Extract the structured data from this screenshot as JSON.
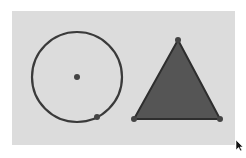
{
  "canvas": {
    "background": "#dcdcdc",
    "rect": {
      "x": 12,
      "y": 11,
      "width": 223,
      "height": 134
    }
  },
  "shapes": {
    "circle": {
      "center": {
        "x": 77,
        "y": 77
      },
      "radius": 45,
      "stroke": "#3a3a3a",
      "fill": "none",
      "center_point": {
        "x": 77,
        "y": 77,
        "r": 3
      },
      "edge_point": {
        "x": 97,
        "y": 117,
        "r": 3
      }
    },
    "triangle": {
      "vertices": [
        {
          "x": 178,
          "y": 40
        },
        {
          "x": 134,
          "y": 119
        },
        {
          "x": 220,
          "y": 119
        }
      ],
      "fill": "#555555",
      "stroke": "#2e2e2e",
      "vertex_r": 3
    }
  },
  "point_color": "#444444",
  "cursor": {
    "x": 236,
    "y": 140
  }
}
